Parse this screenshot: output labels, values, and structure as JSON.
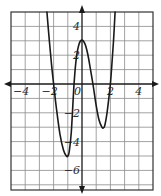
{
  "chart_data": {
    "type": "line",
    "title": "",
    "xlabel": "",
    "ylabel": "",
    "xlim": [
      -5,
      5
    ],
    "ylim": [
      -7.4,
      5
    ],
    "grid": true,
    "grid_step": 1,
    "x_tick_labels": [
      {
        "value": -4,
        "label": "−4"
      },
      {
        "value": -2,
        "label": "−2"
      },
      {
        "value": 0,
        "label": "0"
      },
      {
        "value": 2,
        "label": "2"
      },
      {
        "value": 4,
        "label": "4"
      }
    ],
    "y_tick_labels": [
      {
        "value": 4,
        "label": "4"
      },
      {
        "value": 2,
        "label": "2"
      },
      {
        "value": -2,
        "label": "−2"
      },
      {
        "value": -4,
        "label": "−4"
      },
      {
        "value": -6,
        "label": "−6"
      }
    ],
    "series": [
      {
        "name": "f(x)",
        "description": "quartic-like curve with zeros near x=-2, -0.6, 0.8, 2; local min (-1,-5), local max (0,3), local min (1.5,-3)",
        "x": [
          -2.47,
          -2.3,
          -2.15,
          -2.0,
          -1.8,
          -1.55,
          -1.3,
          -1.1,
          -1.0,
          -0.9,
          -0.75,
          -0.56,
          -0.4,
          -0.2,
          0.0,
          0.2,
          0.4,
          0.6,
          0.77,
          1.0,
          1.2,
          1.4,
          1.5,
          1.6,
          1.75,
          1.9,
          2.0,
          2.1,
          2.22,
          2.33
        ],
        "y": [
          5.0,
          3.0,
          1.4,
          0.0,
          -1.7,
          -3.5,
          -4.6,
          -5.0,
          -5.0,
          -4.7,
          -3.3,
          0.0,
          1.8,
          2.8,
          3.05,
          2.8,
          2.1,
          1.0,
          0.0,
          -1.5,
          -2.5,
          -3.0,
          -3.05,
          -2.9,
          -2.1,
          -0.9,
          0.0,
          1.3,
          3.0,
          5.0
        ]
      }
    ],
    "key_points": {
      "zeros": [
        -2.0,
        -0.56,
        0.77,
        2.0
      ],
      "local_min_left": [
        -1,
        -5
      ],
      "local_max": [
        0,
        3
      ],
      "local_min_right": [
        1.5,
        -3
      ]
    }
  },
  "style": {
    "axis_color": "#1a1a1a",
    "grid_color": "#8a8a8a",
    "curve_color": "#1a1a1a",
    "background": "#ffffff"
  }
}
